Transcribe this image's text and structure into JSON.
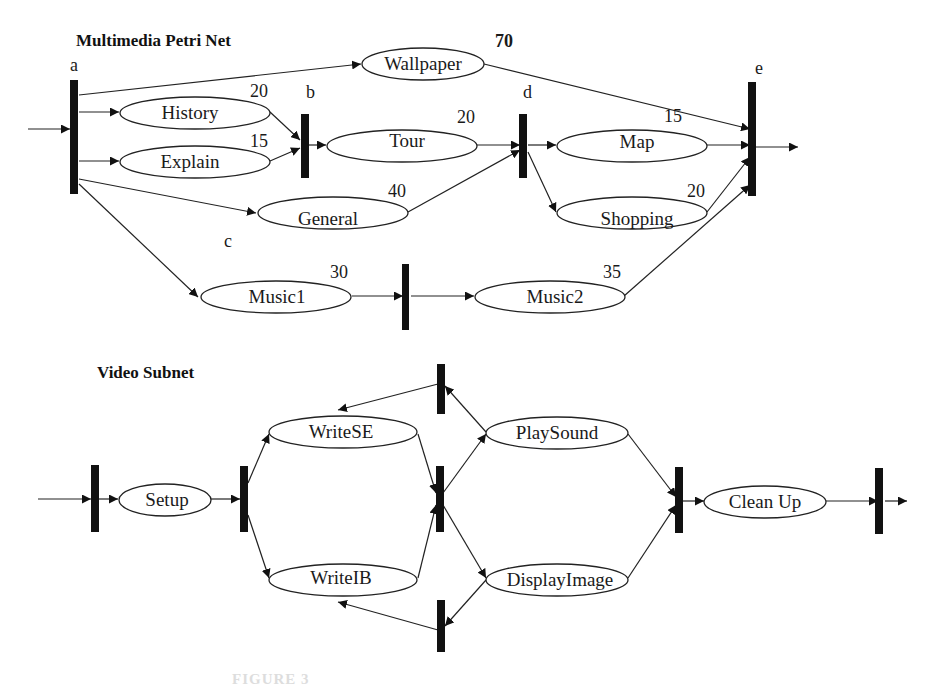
{
  "multimedia_net": {
    "title": "Multimedia Petri Net",
    "transitions": {
      "a": "a",
      "b": "b",
      "c": "c",
      "d": "d",
      "e": "e"
    },
    "places": {
      "wallpaper": {
        "label": "Wallpaper",
        "duration": "70"
      },
      "history": {
        "label": "History",
        "duration": "20"
      },
      "explain": {
        "label": "Explain",
        "duration": "15"
      },
      "tour": {
        "label": "Tour",
        "duration": "20"
      },
      "general": {
        "label": "General",
        "duration": "40"
      },
      "map": {
        "label": "Map",
        "duration": "15"
      },
      "shopping": {
        "label": "Shopping",
        "duration": "20"
      },
      "music1": {
        "label": "Music1",
        "duration": "30"
      },
      "music2": {
        "label": "Music2",
        "duration": "35"
      }
    }
  },
  "video_subnet": {
    "title": "Video Subnet",
    "places": {
      "setup": {
        "label": "Setup"
      },
      "writese": {
        "label": "WriteSE"
      },
      "writeib": {
        "label": "WriteIB"
      },
      "playsound": {
        "label": "PlaySound"
      },
      "displayimage": {
        "label": "DisplayImage"
      },
      "cleanup": {
        "label": "Clean Up"
      }
    }
  },
  "caption": {
    "text": "FIGURE 3"
  }
}
